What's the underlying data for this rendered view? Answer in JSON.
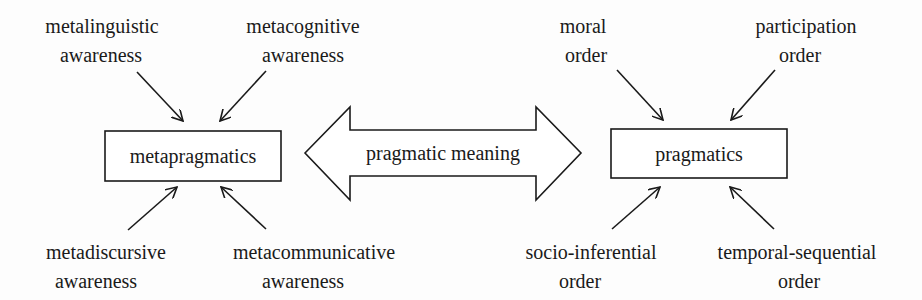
{
  "diagram": {
    "left_node": {
      "label": "metapragmatics",
      "inputs": [
        {
          "line1": "metalinguistic",
          "line2": "awareness",
          "position": "top-left"
        },
        {
          "line1": "metacognitive",
          "line2": "awareness",
          "position": "top-right"
        },
        {
          "line1": "metadiscursive",
          "line2": "awareness",
          "position": "bottom-left"
        },
        {
          "line1": "metacommunicative",
          "line2": "awareness",
          "position": "bottom-right"
        }
      ]
    },
    "connector": {
      "label": "pragmatic meaning",
      "type": "double-headed-block-arrow"
    },
    "right_node": {
      "label": "pragmatics",
      "inputs": [
        {
          "line1": "moral",
          "line2": "order",
          "position": "top-left"
        },
        {
          "line1": "participation",
          "line2": "order",
          "position": "top-right"
        },
        {
          "line1": "socio-inferential",
          "line2": "order",
          "position": "bottom-left"
        },
        {
          "line1": "temporal-sequential",
          "line2": "order",
          "position": "bottom-right"
        }
      ]
    },
    "colors": {
      "stroke": "#1a1a1a",
      "text": "#1a1a1a",
      "background": "#fdfdfd"
    }
  }
}
